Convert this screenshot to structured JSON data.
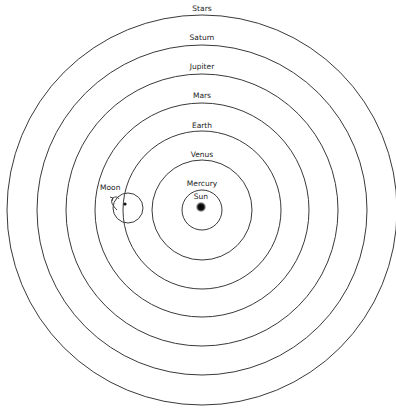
{
  "diagram": {
    "center": {
      "x": 202,
      "y": 210
    },
    "stroke_color": "#3a3a3a",
    "rings": [
      {
        "name": "Mercury",
        "label": "Mercury",
        "r": 20,
        "label_y": 186
      },
      {
        "name": "Venus",
        "label": "Venus",
        "r": 50,
        "label_y": 157
      },
      {
        "name": "Earth",
        "label": "Earth",
        "r": 79,
        "label_y": 128
      },
      {
        "name": "Mars",
        "label": "Mars",
        "r": 107,
        "label_y": 98
      },
      {
        "name": "Jupiter",
        "label": "Jupiter",
        "r": 136,
        "label_y": 69
      },
      {
        "name": "Saturn",
        "label": "Saturn",
        "r": 165,
        "label_y": 40
      },
      {
        "name": "Stars",
        "label": "Stars",
        "r": 195,
        "label_y": 11
      }
    ],
    "sun": {
      "label": "Sun",
      "x": 201,
      "y": 207,
      "r": 5,
      "label_y": 199
    },
    "moon": {
      "label": "Moon",
      "label_x": 100,
      "label_y": 190,
      "epicycle": {
        "cx": 128,
        "cy": 208,
        "r": 15
      },
      "body": {
        "x": 125,
        "y": 204,
        "r": 1.6
      }
    }
  }
}
